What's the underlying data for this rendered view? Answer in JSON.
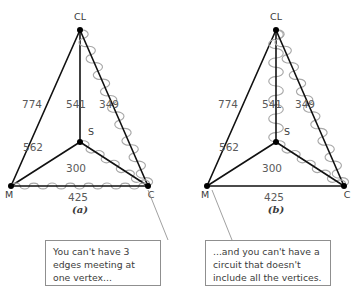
{
  "figure": {
    "background_color": "#ffffff",
    "edge_color": "#111111",
    "highlight_color": "#a8a8a8",
    "text_color": "#4d4d4d",
    "box_border_color": "#8f8f8f"
  },
  "diagrams": [
    {
      "id": "a",
      "caption": "(a)",
      "vertices": [
        {
          "key": "CL",
          "label": "CL"
        },
        {
          "key": "S",
          "label": "S"
        },
        {
          "key": "M",
          "label": "M"
        },
        {
          "key": "C",
          "label": "C"
        }
      ],
      "edges": [
        {
          "from": "CL",
          "to": "M",
          "weight": "774",
          "highlighted": false
        },
        {
          "from": "CL",
          "to": "S",
          "weight": "541",
          "highlighted": false
        },
        {
          "from": "CL",
          "to": "C",
          "weight": "349",
          "highlighted": true
        },
        {
          "from": "M",
          "to": "S",
          "weight": "562",
          "highlighted": false
        },
        {
          "from": "S",
          "to": "C",
          "weight": "300",
          "highlighted": true
        },
        {
          "from": "M",
          "to": "C",
          "weight": "425",
          "highlighted": true
        }
      ]
    },
    {
      "id": "b",
      "caption": "(b)",
      "vertices": [
        {
          "key": "CL",
          "label": "CL"
        },
        {
          "key": "S",
          "label": "S"
        },
        {
          "key": "M",
          "label": "M"
        },
        {
          "key": "C",
          "label": "C"
        }
      ],
      "edges": [
        {
          "from": "CL",
          "to": "M",
          "weight": "774",
          "highlighted": false
        },
        {
          "from": "CL",
          "to": "S",
          "weight": "541",
          "highlighted": true
        },
        {
          "from": "CL",
          "to": "C",
          "weight": "349",
          "highlighted": true
        },
        {
          "from": "M",
          "to": "S",
          "weight": "562",
          "highlighted": false
        },
        {
          "from": "S",
          "to": "C",
          "weight": "300",
          "highlighted": true
        },
        {
          "from": "M",
          "to": "C",
          "weight": "425",
          "highlighted": false
        }
      ]
    }
  ],
  "callouts": [
    {
      "id": "a",
      "text": "You can't have 3 edges meeting at one vertex..."
    },
    {
      "id": "b",
      "text": "...and you can't have a circuit that doesn't include all the vertices."
    }
  ],
  "chart_data": {
    "type": "diagram",
    "title": "",
    "subtitle": "",
    "nodes": [
      "CL",
      "S",
      "M",
      "C"
    ],
    "edge_weights": {
      "CL-M": 774,
      "CL-S": 541,
      "CL-C": 349,
      "M-S": 562,
      "S-C": 300,
      "M-C": 425
    },
    "panels": [
      {
        "label": "(a)",
        "highlighted_edges": [
          "CL-C",
          "S-C",
          "M-C"
        ]
      },
      {
        "label": "(b)",
        "highlighted_edges": [
          "CL-S",
          "CL-C",
          "S-C"
        ]
      }
    ]
  }
}
